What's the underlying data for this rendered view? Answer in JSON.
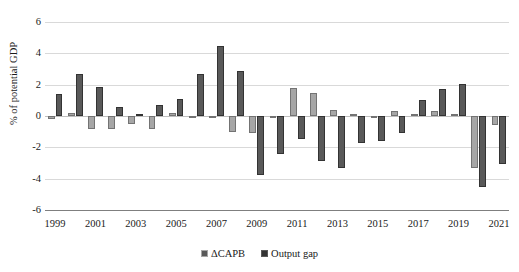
{
  "chart_data": {
    "type": "bar",
    "title": "",
    "xlabel": "",
    "ylabel": "% of potential GDP",
    "ylim": [
      -6,
      6
    ],
    "yticks": [
      6,
      4,
      2,
      0,
      -2,
      -4,
      -6
    ],
    "grid": true,
    "legend_position": "bottom",
    "categories": [
      "1999",
      "2000",
      "2001",
      "2002",
      "2003",
      "2004",
      "2005",
      "2006",
      "2007",
      "2008",
      "2009",
      "2010",
      "2011",
      "2012",
      "2013",
      "2014",
      "2015",
      "2016",
      "2017",
      "2018",
      "2019",
      "2020",
      "2021"
    ],
    "xtick_labels": [
      "1999",
      "2001",
      "2003",
      "2005",
      "2007",
      "2009",
      "2011",
      "2013",
      "2015",
      "2017",
      "2019",
      "2021"
    ],
    "series": [
      {
        "name": "ΔCAPB",
        "color": "#a6a6a6",
        "values": [
          -0.2,
          0.2,
          -0.8,
          -0.8,
          -0.5,
          -0.8,
          0.2,
          -0.1,
          -0.1,
          -1.0,
          -1.1,
          -0.1,
          1.8,
          1.5,
          0.4,
          0.15,
          -0.05,
          0.3,
          0.15,
          0.3,
          0.1,
          -3.3,
          -0.6
        ]
      },
      {
        "name": "Output gap",
        "color": "#595959",
        "values": [
          1.4,
          2.7,
          1.85,
          0.55,
          0.15,
          0.7,
          1.1,
          2.65,
          4.45,
          2.9,
          -3.75,
          -2.45,
          -1.45,
          -2.9,
          -3.35,
          -1.7,
          -1.6,
          -1.1,
          1.0,
          1.7,
          2.05,
          -4.55,
          -3.05
        ]
      }
    ]
  },
  "legend": {
    "items": [
      {
        "label": "ΔCAPB"
      },
      {
        "label": "Output gap"
      }
    ]
  }
}
